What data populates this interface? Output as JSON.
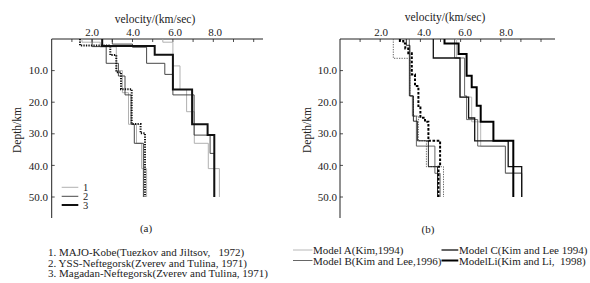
{
  "chart_data": [
    {
      "type": "line",
      "subtype": "step-profile",
      "panel_label": "(a)",
      "title": "",
      "xlabel": "velocity/(km/sec)",
      "ylabel": "Depth/km",
      "x_axis_position": "top",
      "y_inverted": true,
      "xlim": [
        0,
        10.4
      ],
      "ylim": [
        0,
        57
      ],
      "xticks": [
        2,
        4,
        6,
        8
      ],
      "xtick_labels": [
        "2.0",
        "4.0",
        "6.0",
        "8.0"
      ],
      "minor_xtick_step": 1,
      "yticks": [
        10,
        20,
        30,
        40,
        50
      ],
      "ytick_labels": [
        "10.0",
        "20.0",
        "30.0",
        "40.0",
        "50.0"
      ],
      "grid": false,
      "legend": {
        "placement": "bottom-left",
        "entries": [
          {
            "label": "1",
            "color": "#a8a8a8",
            "weight": "thin"
          },
          {
            "label": "2",
            "color": "#333333",
            "weight": "thin"
          },
          {
            "label": "3",
            "color": "#111111",
            "weight": "thick"
          }
        ]
      },
      "captions": [
        "1. MAJO-Kobe(Tuezkov and Jiltsov,   1972)",
        "2. YSS-Neftegorsk(Zverev and Tulina, 1971)",
        "3. Magadan-Neftegorsk(Zverev and Tulina, 1971)"
      ],
      "series": [
        {
          "key": "1",
          "name": "MAJO-Kobe",
          "wave": "S",
          "color": "#a8a8a8",
          "weight": "thin",
          "dash": "solid",
          "bottom_depth": 50,
          "layers": [
            [
              0,
              1.5
            ],
            [
              1,
              2.4
            ],
            [
              2.5,
              3.2
            ],
            [
              10,
              3.5
            ],
            [
              17,
              3.8
            ],
            [
              27,
              4.2
            ],
            [
              33,
              4.45
            ],
            [
              41,
              4.7
            ]
          ]
        },
        {
          "key": "2",
          "name": "YSS-Neftegorsk",
          "wave": "S",
          "color": "#333333",
          "weight": "thin",
          "dash": "solid",
          "bottom_depth": 50,
          "layers": [
            [
              0,
              2.0
            ],
            [
              2.4,
              2.7
            ],
            [
              7.7,
              3.3
            ],
            [
              11.7,
              3.63
            ],
            [
              17.7,
              3.93
            ],
            [
              27,
              4.09
            ],
            [
              33,
              4.54
            ]
          ]
        },
        {
          "key": "3",
          "name": "Magadan-Neftegorsk",
          "wave": "S",
          "color": "#111111",
          "weight": "thick",
          "dash": "dotted",
          "bottom_depth": 50,
          "layers": [
            [
              0,
              1.4
            ],
            [
              2.1,
              2.9
            ],
            [
              5.1,
              3.2
            ],
            [
              10.5,
              3.43
            ],
            [
              15.9,
              3.96
            ],
            [
              26.9,
              4.4
            ],
            [
              29.8,
              4.62
            ]
          ]
        },
        {
          "key": "1",
          "name": "MAJO-Kobe",
          "wave": "P",
          "color": "#a8a8a8",
          "weight": "thin",
          "dash": "solid",
          "bottom_depth": 50,
          "layers": [
            [
              0,
              5.5
            ],
            [
              1,
              6.0
            ],
            [
              8.5,
              6.35
            ],
            [
              16,
              6.68
            ],
            [
              23,
              7.06
            ],
            [
              33,
              7.75
            ],
            [
              41,
              8.3
            ]
          ]
        },
        {
          "key": "2",
          "name": "YSS-Neftegorsk",
          "wave": "P",
          "color": "#333333",
          "weight": "thin",
          "dash": "solid",
          "bottom_depth": 50,
          "layers": [
            [
              0,
              3.0
            ],
            [
              1.6,
              4.0
            ],
            [
              2.6,
              4.7
            ],
            [
              7.7,
              5.6
            ],
            [
              11.2,
              6.0
            ],
            [
              17.7,
              7.05
            ],
            [
              30.4,
              7.84
            ],
            [
              36.2,
              8.05
            ]
          ]
        },
        {
          "key": "3",
          "name": "Magadan-Neftegorsk",
          "wave": "P",
          "color": "#111111",
          "weight": "thick",
          "dash": "solid",
          "bottom_depth": 50,
          "layers": [
            [
              0,
              2.5
            ],
            [
              2.2,
              5.1
            ],
            [
              5,
              6.0
            ],
            [
              16,
              6.95
            ],
            [
              27,
              7.72
            ],
            [
              30.4,
              8.05
            ]
          ]
        }
      ]
    },
    {
      "type": "line",
      "subtype": "step-profile",
      "panel_label": "(b)",
      "title": "",
      "xlabel": "velocity/(km/sec)",
      "ylabel": "Depth/km",
      "x_axis_position": "top",
      "y_inverted": true,
      "xlim": [
        0,
        10.7
      ],
      "ylim": [
        0,
        57
      ],
      "xticks": [
        2,
        4,
        6,
        8
      ],
      "xtick_labels": [
        "2.0",
        "4.0",
        "6.0",
        "8.0"
      ],
      "minor_xtick_step": 1,
      "yticks": [
        10,
        20,
        30,
        40,
        50
      ],
      "ytick_labels": [
        "10.0",
        "20.0",
        "30.0",
        "40.0",
        "50.0"
      ],
      "grid": false,
      "legend": {
        "placement": "bottom",
        "entries": [
          {
            "label": "Model A(Kim,1994)",
            "color": "#b0b0b0",
            "weight": "thin"
          },
          {
            "label": "Model B(Kim and Lee,1996)",
            "color": "#555555",
            "weight": "thin"
          },
          {
            "label": "Model C(Kim and Lee 1994)",
            "color": "#111111",
            "weight": "medium"
          },
          {
            "label": "ModelLi(Kim and Li,  1998)",
            "color": "#000000",
            "weight": "thick"
          }
        ]
      },
      "series": [
        {
          "key": "A",
          "name": "Model A",
          "wave": "S",
          "color": "#555555",
          "weight": "thin",
          "dash": "dotted",
          "bottom_depth": 50,
          "layers": [
            [
              0,
              2.65
            ],
            [
              6.1,
              3.48
            ],
            [
              18,
              3.65
            ],
            [
              24.4,
              3.9
            ],
            [
              32.2,
              4.3
            ],
            [
              40.4,
              5.15
            ]
          ]
        },
        {
          "key": "B",
          "name": "Model B",
          "wave": "S",
          "color": "#555555",
          "weight": "thin",
          "dash": "solid",
          "bottom_depth": 50,
          "layers": [
            [
              0,
              3.45
            ],
            [
              18,
              3.6
            ],
            [
              24.4,
              3.8
            ],
            [
              33.9,
              4.72
            ],
            [
              42.5,
              4.98
            ]
          ]
        },
        {
          "key": "C",
          "name": "Model C",
          "wave": "S",
          "color": "#111111",
          "weight": "thin",
          "dash": "solid",
          "bottom_depth": 50,
          "layers": [
            [
              0,
              3.3
            ],
            [
              2,
              3.48
            ],
            [
              18,
              3.65
            ],
            [
              26,
              3.85
            ],
            [
              32.2,
              4.4
            ],
            [
              40.4,
              4.85
            ]
          ]
        },
        {
          "key": "Li",
          "name": "ModelLi",
          "wave": "S",
          "color": "#000000",
          "weight": "thick",
          "dash": "dashed",
          "bottom_depth": 50,
          "layers": [
            [
              0,
              2.98
            ],
            [
              0.6,
              3.15
            ],
            [
              1.4,
              3.25
            ],
            [
              3,
              3.4
            ],
            [
              4.5,
              3.57
            ],
            [
              11.2,
              3.73
            ],
            [
              14.9,
              3.9
            ],
            [
              21.7,
              4.0
            ],
            [
              24.9,
              4.23
            ],
            [
              26.2,
              4.4
            ],
            [
              32.2,
              4.98
            ],
            [
              40.4,
              4.9
            ]
          ]
        },
        {
          "key": "A",
          "name": "Model A",
          "wave": "P",
          "color": "#b0b0b0",
          "weight": "thin",
          "dash": "solid",
          "bottom_depth": 50,
          "layers": [
            [
              0,
              5.8
            ],
            [
              6,
              5.97
            ],
            [
              18.4,
              6.55
            ],
            [
              26.2,
              7.0
            ],
            [
              34,
              8.23
            ],
            [
              42.3,
              9.04
            ]
          ]
        },
        {
          "key": "B",
          "name": "Model B",
          "wave": "P",
          "color": "#555555",
          "weight": "thin",
          "dash": "solid",
          "bottom_depth": 50,
          "layers": [
            [
              0,
              5.7
            ],
            [
              6,
              6.2
            ],
            [
              18,
              6.3
            ],
            [
              25.5,
              6.85
            ],
            [
              33.9,
              8.23
            ],
            [
              42.5,
              9.04
            ]
          ]
        },
        {
          "key": "C",
          "name": "Model C",
          "wave": "P",
          "color": "#111111",
          "weight": "medium",
          "dash": "solid",
          "bottom_depth": 50,
          "layers": [
            [
              0,
              4.64
            ],
            [
              6,
              5.97
            ],
            [
              18.4,
              6.4
            ],
            [
              25,
              6.7
            ],
            [
              32.2,
              8.37
            ],
            [
              40.4,
              9.04
            ]
          ]
        },
        {
          "key": "Li",
          "name": "ModelLi",
          "wave": "P",
          "color": "#000000",
          "weight": "thick",
          "dash": "solid",
          "bottom_depth": 50,
          "layers": [
            [
              0,
              5.2
            ],
            [
              1.4,
              5.9
            ],
            [
              4.7,
              6.3
            ],
            [
              11.6,
              6.55
            ],
            [
              15.3,
              6.8
            ],
            [
              21.1,
              7.0
            ],
            [
              26.2,
              7.63
            ],
            [
              32.2,
              8.62
            ]
          ]
        }
      ]
    }
  ]
}
